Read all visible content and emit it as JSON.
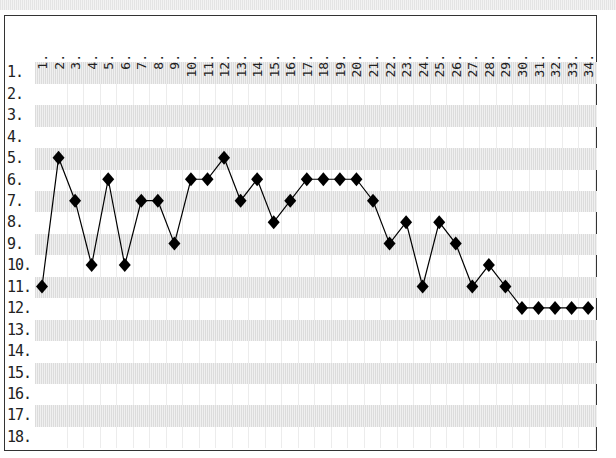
{
  "chart_data": {
    "type": "line",
    "title": "",
    "xlabel": "",
    "ylabel": "",
    "x": [
      1,
      2,
      3,
      4,
      5,
      6,
      7,
      8,
      9,
      10,
      11,
      12,
      13,
      14,
      15,
      16,
      17,
      18,
      19,
      20,
      21,
      22,
      23,
      24,
      25,
      26,
      27,
      28,
      29,
      30,
      31,
      32,
      33,
      34
    ],
    "x_tick_labels": [
      "1.",
      "2.",
      "3.",
      "4.",
      "5.",
      "6.",
      "7.",
      "8.",
      "9.",
      "10.",
      "11.",
      "12.",
      "13.",
      "14.",
      "15.",
      "16.",
      "17.",
      "18.",
      "19.",
      "20.",
      "21.",
      "22.",
      "23.",
      "24.",
      "25.",
      "26.",
      "27.",
      "28.",
      "29.",
      "30.",
      "31.",
      "32.",
      "33.",
      "34."
    ],
    "y_tick_labels": [
      "1.",
      "2.",
      "3.",
      "4.",
      "5.",
      "6.",
      "7.",
      "8.",
      "9.",
      "10.",
      "11.",
      "12.",
      "13.",
      "14.",
      "15.",
      "16.",
      "17.",
      "18."
    ],
    "series": [
      {
        "name": "rank",
        "marker": "diamond",
        "color": "#000000",
        "values": [
          11,
          5,
          7,
          10,
          6,
          10,
          7,
          7,
          9,
          6,
          6,
          5,
          7,
          6,
          8,
          7,
          6,
          6,
          6,
          6,
          7,
          9,
          8,
          11,
          8,
          9,
          11,
          10,
          11,
          12,
          12,
          12,
          12,
          12
        ]
      }
    ],
    "ylim": [
      1,
      18
    ],
    "y_inverted": true,
    "grid": true,
    "legend": null
  },
  "style": {
    "line_color": "#000000",
    "marker_color": "#000000",
    "border_color": "#333333",
    "shade_color": "#e6e6e6"
  }
}
